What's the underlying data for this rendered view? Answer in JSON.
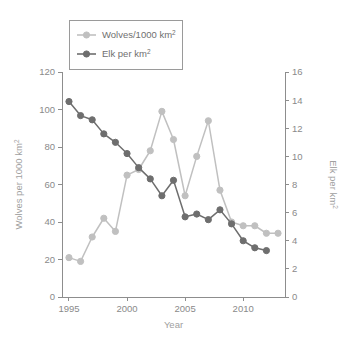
{
  "chart_data": {
    "type": "line",
    "title": "",
    "xlabel": "Year",
    "x": [
      1995,
      1996,
      1997,
      1998,
      1999,
      2000,
      2001,
      2002,
      2003,
      2004,
      2005,
      2006,
      2007,
      2008,
      2009,
      2010,
      2011,
      2012,
      2013
    ],
    "xlim": [
      1994.4,
      2013.6
    ],
    "xticks": [
      1995,
      2000,
      2005,
      2010
    ],
    "xticklabels": [
      "1995",
      "2000",
      "2005",
      "2010"
    ],
    "grid": false,
    "legend_position": "top-left",
    "axes": [
      {
        "id": "left",
        "label": "Wolves per 1000 km",
        "label_sup": "2",
        "lim": [
          0,
          120
        ],
        "ticks": [
          0,
          20,
          40,
          60,
          80,
          100,
          120
        ],
        "ticklabels": [
          "0",
          "20",
          "40",
          "60",
          "80",
          "100",
          "120"
        ],
        "color": "#b4b4b4"
      },
      {
        "id": "right",
        "label": "Elk per km",
        "label_sup": "2",
        "lim": [
          0,
          16
        ],
        "ticks": [
          0,
          2,
          4,
          6,
          8,
          10,
          12,
          14,
          16
        ],
        "ticklabels": [
          "0",
          "2",
          "4",
          "6",
          "8",
          "10",
          "12",
          "14",
          "16"
        ],
        "color": "#8a8a8a"
      }
    ],
    "series": [
      {
        "name": "Wolves/1000 km",
        "name_sup": "2",
        "axis": "left",
        "color": "#c0c0c0",
        "marker": "circle",
        "x": [
          1995,
          1996,
          1997,
          1998,
          1999,
          2000,
          2001,
          2002,
          2003,
          2004,
          2005,
          2006,
          2007,
          2008,
          2009,
          2010,
          2011,
          2012,
          2013
        ],
        "values": [
          21,
          19,
          32,
          42,
          35,
          65,
          68,
          78,
          99,
          84,
          54,
          75,
          94,
          57,
          40,
          38,
          38,
          34,
          34
        ]
      },
      {
        "name": "Elk per km",
        "name_sup": "2",
        "axis": "right",
        "color": "#6e6e6e",
        "marker": "circle",
        "x": [
          1995,
          1996,
          1997,
          1998,
          1999,
          2000,
          2001,
          2002,
          2003,
          2004,
          2005,
          2006,
          2007,
          2008,
          2009,
          2010,
          2011,
          2012
        ],
        "values": [
          13.9,
          12.9,
          12.6,
          11.6,
          11.0,
          10.2,
          9.2,
          8.4,
          7.2,
          8.3,
          5.7,
          5.9,
          5.5,
          6.2,
          5.2,
          4.0,
          3.5,
          3.3
        ]
      }
    ]
  },
  "legend": {
    "entries": [
      {
        "label": "Wolves/1000 km",
        "sup": "2",
        "color": "#c0c0c0"
      },
      {
        "label": "Elk per km",
        "sup": "2",
        "color": "#6e6e6e"
      }
    ]
  }
}
